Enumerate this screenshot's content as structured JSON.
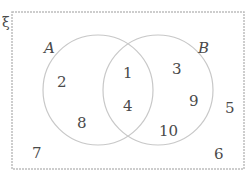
{
  "diagram": {
    "type": "venn",
    "universal_symbol": "ξ",
    "sets": [
      {
        "name": "A",
        "label": "A"
      },
      {
        "name": "B",
        "label": "B"
      }
    ],
    "regions": {
      "a_only": [
        "2",
        "8"
      ],
      "a_and_b": [
        "1",
        "4"
      ],
      "b_only": [
        "3",
        "9",
        "10"
      ],
      "outside": [
        "5",
        "6",
        "7"
      ]
    },
    "colors": {
      "border": "#bdbdbd",
      "circle": "#c8c8c8",
      "text": "#4a4a4a"
    }
  }
}
